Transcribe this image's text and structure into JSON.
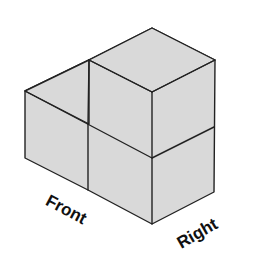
{
  "diagram": {
    "type": "isometric cube arrangement",
    "cube_count": 3,
    "fill_color": "#d9d9d9",
    "stroke_color": "#222222",
    "labels": {
      "front": "Front",
      "right": "Right"
    }
  }
}
